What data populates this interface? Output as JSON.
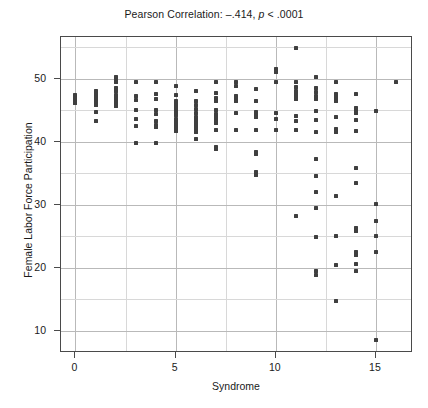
{
  "chart_data": {
    "type": "scatter",
    "title": "Pearson Correlation: –.414, p < .0001",
    "title_prefix": "Pearson Correlation: –.414, ",
    "title_italic": "p",
    "title_suffix": " < .0001",
    "xlabel": "Syndrome",
    "ylabel": "Female Labor Force Participation",
    "xlim": [
      -0.72,
      16.85
    ],
    "ylim": [
      6.5,
      56.6
    ],
    "xticks": [
      0,
      5,
      10,
      15
    ],
    "yticks": [
      10,
      20,
      30,
      40,
      50
    ],
    "xtick_labels": [
      "0",
      "5",
      "10",
      "15"
    ],
    "ytick_labels": [
      "10",
      "20",
      "30",
      "40",
      "50"
    ],
    "x_gridlines": [
      0,
      2.5,
      5,
      7.5,
      10,
      12.5,
      15
    ],
    "y_gridlines": [
      10,
      15,
      20,
      25,
      30,
      35,
      40,
      45,
      50,
      55
    ],
    "grid": true,
    "legend": null,
    "marker_color": "#3f3f3f",
    "grid_color": "#b9b9b9",
    "frame_color": "#4a4a4a",
    "points": [
      [
        0,
        47.4
      ],
      [
        0,
        47.2
      ],
      [
        0,
        47.0
      ],
      [
        0,
        46.8
      ],
      [
        0,
        46.6
      ],
      [
        0,
        46.4
      ],
      [
        0,
        46.2
      ],
      [
        1,
        48.0
      ],
      [
        1,
        47.7
      ],
      [
        1,
        47.4
      ],
      [
        1,
        47.1
      ],
      [
        1,
        46.9
      ],
      [
        1,
        46.7
      ],
      [
        1,
        46.5
      ],
      [
        1,
        46.3
      ],
      [
        1,
        46.1
      ],
      [
        1,
        45.9
      ],
      [
        1,
        44.7
      ],
      [
        1,
        43.3
      ],
      [
        2,
        50.3
      ],
      [
        2,
        50.0
      ],
      [
        2,
        49.4
      ],
      [
        2,
        48.6
      ],
      [
        2,
        48.0
      ],
      [
        2,
        47.4
      ],
      [
        2,
        46.9
      ],
      [
        2,
        46.6
      ],
      [
        2,
        46.3
      ],
      [
        2,
        46.0
      ],
      [
        2,
        45.7
      ],
      [
        3,
        49.5
      ],
      [
        3,
        47.3
      ],
      [
        3,
        46.6
      ],
      [
        3,
        45.0
      ],
      [
        3,
        43.6
      ],
      [
        3,
        42.5
      ],
      [
        3,
        39.8
      ],
      [
        4,
        49.5
      ],
      [
        4,
        47.6
      ],
      [
        4,
        46.7
      ],
      [
        4,
        45.0
      ],
      [
        4,
        44.4
      ],
      [
        4,
        43.3
      ],
      [
        4,
        42.6
      ],
      [
        4,
        42.4
      ],
      [
        4,
        39.8
      ],
      [
        5,
        48.9
      ],
      [
        5,
        47.4
      ],
      [
        5,
        46.5
      ],
      [
        5,
        46.1
      ],
      [
        5,
        45.6
      ],
      [
        5,
        45.2
      ],
      [
        5,
        44.7
      ],
      [
        5,
        44.2
      ],
      [
        5,
        43.6
      ],
      [
        5,
        43.1
      ],
      [
        5,
        42.6
      ],
      [
        5,
        42.2
      ],
      [
        5,
        42.0
      ],
      [
        5,
        41.7
      ],
      [
        6,
        48.0
      ],
      [
        6,
        46.5
      ],
      [
        6,
        45.8
      ],
      [
        6,
        45.2
      ],
      [
        6,
        44.6
      ],
      [
        6,
        44.0
      ],
      [
        6,
        43.4
      ],
      [
        6,
        43.0
      ],
      [
        6,
        42.8
      ],
      [
        6,
        42.5
      ],
      [
        6,
        42.2
      ],
      [
        6,
        41.9
      ],
      [
        6,
        41.6
      ],
      [
        6,
        40.5
      ],
      [
        7,
        49.5
      ],
      [
        7,
        47.7
      ],
      [
        7,
        47.0
      ],
      [
        7,
        46.5
      ],
      [
        7,
        45.1
      ],
      [
        7,
        44.4
      ],
      [
        7,
        43.9
      ],
      [
        7,
        43.5
      ],
      [
        7,
        43.2
      ],
      [
        7,
        42.9
      ],
      [
        7,
        41.8
      ],
      [
        7,
        39.2
      ],
      [
        7,
        38.9
      ],
      [
        8,
        49.4
      ],
      [
        8,
        48.8
      ],
      [
        8,
        47.2
      ],
      [
        8,
        46.7
      ],
      [
        8,
        46.4
      ],
      [
        8,
        44.6
      ],
      [
        8,
        41.9
      ],
      [
        9,
        48.4
      ],
      [
        9,
        46.4
      ],
      [
        9,
        44.7
      ],
      [
        9,
        44.3
      ],
      [
        9,
        44.0
      ],
      [
        9,
        41.8
      ],
      [
        9,
        38.4
      ],
      [
        9,
        38.0
      ],
      [
        9,
        35.2
      ],
      [
        9,
        34.8
      ],
      [
        10,
        51.5
      ],
      [
        10,
        51.0
      ],
      [
        10,
        49.5
      ],
      [
        10,
        44.5
      ],
      [
        10,
        43.6
      ],
      [
        10,
        41.9
      ],
      [
        11,
        54.8
      ],
      [
        11,
        49.5
      ],
      [
        11,
        48.7
      ],
      [
        11,
        48.1
      ],
      [
        11,
        47.6
      ],
      [
        11,
        47.2
      ],
      [
        11,
        46.7
      ],
      [
        11,
        44.1
      ],
      [
        11,
        43.3
      ],
      [
        11,
        41.9
      ],
      [
        11,
        28.3
      ],
      [
        12,
        50.3
      ],
      [
        12,
        48.6
      ],
      [
        12,
        47.9
      ],
      [
        12,
        47.3
      ],
      [
        12,
        46.7
      ],
      [
        12,
        44.8
      ],
      [
        12,
        43.4
      ],
      [
        12,
        41.6
      ],
      [
        12,
        37.3
      ],
      [
        12,
        34.5
      ],
      [
        12,
        32.0
      ],
      [
        12,
        29.5
      ],
      [
        12,
        24.9
      ],
      [
        12,
        19.5
      ],
      [
        12,
        18.8
      ],
      [
        13,
        49.5
      ],
      [
        13,
        47.6
      ],
      [
        13,
        47.4
      ],
      [
        13,
        47.2
      ],
      [
        13,
        47.0
      ],
      [
        13,
        46.7
      ],
      [
        13,
        46.5
      ],
      [
        13,
        44.0
      ],
      [
        13,
        42.0
      ],
      [
        13,
        41.6
      ],
      [
        13,
        31.4
      ],
      [
        13,
        25.0
      ],
      [
        13,
        20.5
      ],
      [
        13,
        14.8
      ],
      [
        14,
        47.6
      ],
      [
        14,
        45.4
      ],
      [
        14,
        44.9
      ],
      [
        14,
        44.5
      ],
      [
        14,
        43.4
      ],
      [
        14,
        41.7
      ],
      [
        14,
        35.8
      ],
      [
        14,
        33.5
      ],
      [
        14,
        26.4
      ],
      [
        14,
        25.8
      ],
      [
        14,
        22.5
      ],
      [
        14,
        22.0
      ],
      [
        14,
        20.6
      ],
      [
        14,
        19.5
      ],
      [
        15,
        44.8
      ],
      [
        15,
        30.1
      ],
      [
        15,
        27.5
      ],
      [
        15,
        25.0
      ],
      [
        15,
        22.6
      ],
      [
        15,
        8.5
      ],
      [
        16,
        49.4
      ]
    ]
  }
}
